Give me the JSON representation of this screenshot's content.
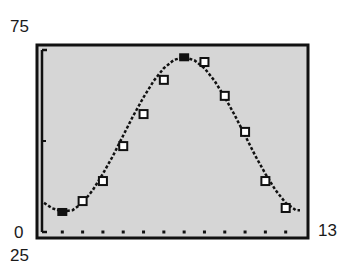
{
  "window": {
    "ymax_label": "75",
    "ymin_label": "25",
    "xmin_label": "0",
    "xmax_label": "13"
  },
  "colors": {
    "screen_bg": "#d6d6d6",
    "ink": "#111111",
    "page_bg": "#ffffff"
  },
  "chart_data": {
    "type": "scatter",
    "title": "",
    "xlabel": "",
    "ylabel": "",
    "xlim": [
      0,
      13
    ],
    "ylim": [
      25,
      75
    ],
    "grid": false,
    "x_tick_marks": [
      1,
      2,
      3,
      4,
      5,
      6,
      7,
      8,
      9,
      10,
      11,
      12
    ],
    "y_tick_marks": [
      50
    ],
    "series": [
      {
        "name": "data points",
        "marker": "square-open",
        "x": [
          1,
          2,
          3,
          4,
          5,
          6,
          7,
          8,
          9,
          10,
          11,
          12
        ],
        "values": [
          30.5,
          33.5,
          39,
          48.6,
          57.4,
          66.8,
          73,
          71.7,
          62.4,
          52.5,
          39,
          31.6
        ]
      },
      {
        "name": "extrema",
        "marker": "filled",
        "x": [
          1,
          7
        ],
        "values": [
          30.5,
          73
        ]
      },
      {
        "name": "fitted sine curve",
        "type": "line",
        "style": "dotted",
        "model": "y = 21.3*sin(0.52x - 2.09) + 51.7",
        "x": [
          0.1,
          0.5,
          1,
          1.5,
          2,
          2.5,
          3,
          3.5,
          4,
          4.5,
          5,
          5.5,
          6,
          6.5,
          7,
          7.5,
          8,
          8.5,
          9,
          9.5,
          10,
          10.5,
          11,
          11.5,
          12,
          12.5
        ],
        "values": [
          33.0,
          31.5,
          30.6,
          31.0,
          33.0,
          36.5,
          41.0,
          46.0,
          51.5,
          57.0,
          62.0,
          66.5,
          70.0,
          72.3,
          73.0,
          72.2,
          70.0,
          66.5,
          62.0,
          57.0,
          51.5,
          46.0,
          41.0,
          36.5,
          33.0,
          31.0
        ]
      }
    ]
  }
}
